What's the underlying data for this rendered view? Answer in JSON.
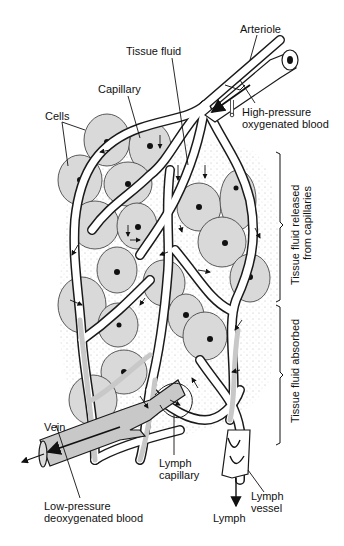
{
  "figure": {
    "type": "biology-diagram"
  },
  "labels": {
    "arteriole": "Arteriole",
    "tissue_fluid": "Tissue fluid",
    "capillary": "Capillary",
    "cells": "Cells",
    "high_pressure_1": "High-pressure",
    "high_pressure_2": "oxygenated blood",
    "released_1": "Tissue fluid released",
    "released_2": "from capillaries",
    "absorbed": "Tissue fluid absorbed",
    "vein": "Vein",
    "low_pressure_1": "Low-pressure",
    "low_pressure_2": "deoxygenated blood",
    "lymph_capillary_1": "Lymph",
    "lymph_capillary_2": "capillary",
    "lymph_vessel_1": "Lymph",
    "lymph_vessel_2": "vessel",
    "lymph": "Lymph"
  },
  "colors": {
    "cell_fill": "#d9d9d9",
    "vein_fill": "#c8c8c8",
    "vessel_outline": "#1a1a1a",
    "background": "#ffffff"
  }
}
